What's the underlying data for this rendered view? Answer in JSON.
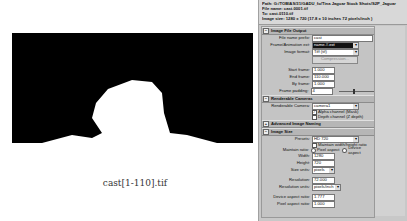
{
  "figure": {
    "caption": "cast[1-110].tif",
    "render_bg": "#000000",
    "silhouette_color": "#ffffff"
  },
  "panel": {
    "header": {
      "path": "Path: G:/TOBIAS/31/GADU_fo/Tina Jaguar Stock Shots/S2P_Jaguar",
      "file_name": "File name:  cast.0001.tif",
      "to": "To:          cast.0110.tif",
      "image_size": "Image size: 1280 x 720 (17.8 x 10 inches 72 pixels/inch )"
    },
    "sections": {
      "image_file_output": {
        "title": "Image File Output",
        "file_name_prefix_label": "File name prefix:",
        "file_name_prefix_value": "cast",
        "frame_animation_ext_label": "Frame/Animation ext:",
        "frame_animation_ext_value": "name.#.ext",
        "image_format_label": "Image format:",
        "image_format_value": "Tiff (tif)",
        "compression_label": "Compression...",
        "start_frame_label": "Start frame:",
        "start_frame_value": "1.000",
        "end_frame_label": "End frame:",
        "end_frame_value": "110.000",
        "by_frame_label": "By frame:",
        "by_frame_value": "1.000",
        "frame_padding_label": "Frame padding:",
        "frame_padding_value": "4"
      },
      "renderable_cameras": {
        "title": "Renderable Cameras",
        "renderable_camera_label": "Renderable Camera:",
        "renderable_camera_value": "camera1",
        "alpha_channel_label": "Alpha channel (Mask)",
        "alpha_channel_checked": true,
        "depth_channel_label": "Depth channel (Z depth)",
        "depth_channel_checked": false
      },
      "advanced_image_naming": {
        "title": "Advanced Image Naming"
      },
      "image_size": {
        "title": "Image Size",
        "presets_label": "Presets:",
        "presets_value": "HD 720",
        "maintain_ratio_checkbox_label": "Maintain width/height ratio",
        "maintain_ratio_label": "Maintain ratio:",
        "pixel_aspect_radio_label": "Pixel aspect",
        "device_aspect_radio_label": "Device aspect",
        "width_label": "Width:",
        "width_value": "1280",
        "height_label": "Height:",
        "height_value": "720",
        "size_units_label": "Size units:",
        "size_units_value": "pixels",
        "resolution_label": "Resolution:",
        "resolution_value": "72.000",
        "resolution_units_label": "Resolution units:",
        "resolution_units_value": "pixels/inch",
        "device_aspect_ratio_label": "Device aspect ratio:",
        "device_aspect_ratio_value": "1.777",
        "pixel_aspect_ratio_label": "Pixel aspect ratio:",
        "pixel_aspect_ratio_value": "1.000"
      }
    }
  }
}
